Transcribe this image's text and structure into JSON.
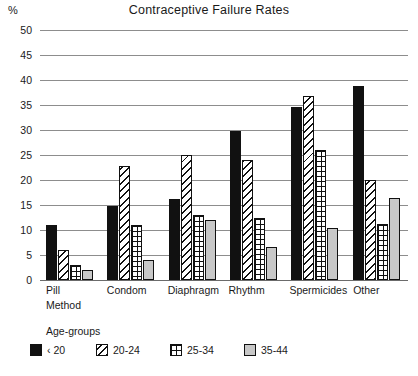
{
  "axis_unit_label": "%",
  "chart_data": {
    "type": "bar",
    "title": "Contraceptive Failure Rates",
    "xlabel": "Method",
    "ylabel": "%",
    "ylim": [
      0,
      50
    ],
    "yticks": [
      0,
      5,
      10,
      15,
      20,
      25,
      30,
      35,
      40,
      45,
      50
    ],
    "grid": true,
    "legend_title": "Age-groups",
    "legend_position": "bottom-left",
    "categories": [
      "Pill",
      "Condom",
      "Diaphragm",
      "Rhythm",
      "Spermicides",
      "Other"
    ],
    "series": [
      {
        "name": "‹ 20",
        "pattern": "solid-black",
        "color": "#111111",
        "values": [
          11.0,
          14.8,
          16.3,
          29.8,
          34.7,
          38.8
        ]
      },
      {
        "name": "20-24",
        "pattern": "diagonal-hatch",
        "color": "#ffffff",
        "values": [
          6.0,
          22.8,
          25.0,
          24.0,
          36.8,
          20.0
        ]
      },
      {
        "name": "25-34",
        "pattern": "cross-grid",
        "color": "#ffffff",
        "values": [
          3.0,
          11.0,
          13.0,
          12.5,
          26.0,
          11.2
        ]
      },
      {
        "name": "35-44",
        "pattern": "light-gray",
        "color": "#c8c8c8",
        "values": [
          2.0,
          4.0,
          12.0,
          6.7,
          10.4,
          16.5
        ]
      }
    ]
  }
}
